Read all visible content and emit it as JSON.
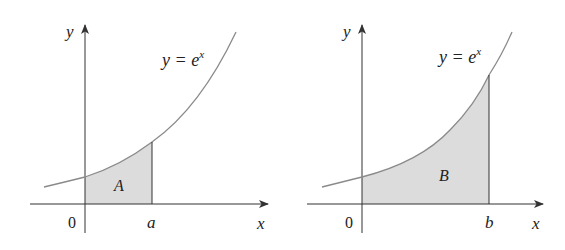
{
  "figures": [
    {
      "id": "left",
      "curve_label": {
        "base": "y = e",
        "exponent": "x"
      },
      "x_axis_label": "x",
      "y_axis_label": "y",
      "origin_label": "0",
      "bound_label": "a",
      "region_label": "A"
    },
    {
      "id": "right",
      "curve_label": {
        "base": "y = e",
        "exponent": "x"
      },
      "x_axis_label": "x",
      "y_axis_label": "y",
      "origin_label": "0",
      "bound_label": "b",
      "region_label": "B"
    }
  ],
  "colors": {
    "background": "#ffffff",
    "axis": "#333333",
    "curve": "#8a8a8a",
    "fill": "#dcdcdc",
    "text": "#222222"
  }
}
